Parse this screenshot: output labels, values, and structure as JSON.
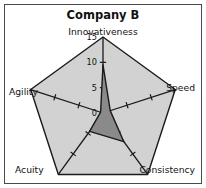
{
  "chart_data": {
    "type": "radar",
    "title": "Company B",
    "categories": [
      "Innovativeness",
      "Speed",
      "Consistency",
      "Acuity",
      "Agility"
    ],
    "series": [
      {
        "name": "Company B",
        "values": [
          9.5,
          1.5,
          7,
          4.5,
          0.5
        ],
        "fill": "#8a8a8a",
        "stroke": "#1a1a1a"
      },
      {
        "name": "Reference maximum",
        "values": [
          15,
          15,
          15,
          15,
          15
        ],
        "fill": "#d2d2d2",
        "stroke": "#1a1a1a"
      }
    ],
    "radial_axis": {
      "label_axis": "Innovativeness",
      "min": 0,
      "max": 15,
      "tick_values": [
        0,
        5,
        10,
        15
      ],
      "tick_labels": [
        "0",
        "5",
        "10",
        "15"
      ],
      "tick_marks_per_spoke": [
        5,
        10
      ],
      "grid": false
    },
    "legend": {
      "visible": false
    },
    "xlabel": "",
    "ylabel": "",
    "background": "#ffffff",
    "border_color": "#4a4a4a"
  },
  "labels": {
    "title": "Company B",
    "axis_innovativeness": "Innovativeness",
    "axis_speed": "Speed",
    "axis_consistency": "Consistency",
    "axis_acuity": "Acuity",
    "axis_agility": "Agility",
    "tick_15": "15",
    "tick_10": "10",
    "tick_5": "5",
    "tick_0": "0"
  }
}
